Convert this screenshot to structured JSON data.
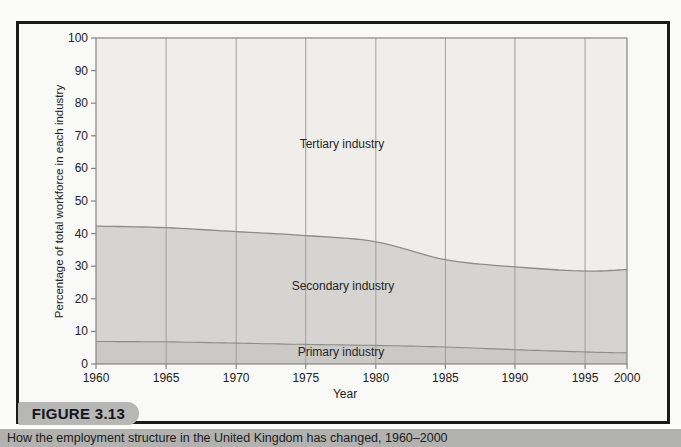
{
  "figure": {
    "badge_label": "FIGURE 3.13",
    "caption": "How the employment structure in the United Kingdom has changed, 1960–2000"
  },
  "chart": {
    "ylabel": "Percentage of total workforce in each industry",
    "xlabel": "Year",
    "area_labels": {
      "tertiary": "Tertiary industry",
      "secondary": "Secondary industry",
      "primary": "Primary industry"
    }
  },
  "chart_data": {
    "type": "area",
    "stacked": true,
    "title": "",
    "xlabel": "Year",
    "ylabel": "Percentage of total workforce in each industry",
    "categories": [
      "1960",
      "1965",
      "1970",
      "1975",
      "1980",
      "1985",
      "1990",
      "1995",
      "2000"
    ],
    "series": [
      {
        "name": "Primary industry",
        "values": [
          6.9,
          6.8,
          6.4,
          6.0,
          5.7,
          5.2,
          4.4,
          3.7,
          3.4
        ]
      },
      {
        "name": "Secondary industry",
        "values": [
          35.4,
          35.0,
          34.2,
          33.4,
          31.8,
          26.8,
          25.4,
          24.8,
          25.6
        ]
      },
      {
        "name": "Tertiary industry",
        "values": [
          57.7,
          58.2,
          59.4,
          60.6,
          62.5,
          68.0,
          70.2,
          71.5,
          71.0
        ]
      }
    ],
    "ylim": [
      0,
      100
    ],
    "yticks": [
      0,
      10,
      20,
      30,
      40,
      50,
      60,
      70,
      80,
      90,
      100
    ],
    "grid": "vertical",
    "legend_position": "none",
    "x_positions_pct": [
      0,
      13.2,
      26.4,
      39.5,
      52.7,
      65.8,
      78.9,
      92.1,
      100
    ],
    "colors": {
      "tertiary_fill": "#efeeeb",
      "secondary_fill": "#d5d4d1",
      "primary_fill": "#cac9c6",
      "boundary_line": "#8c8c89",
      "grid_line": "#9f9f9c",
      "axis_line": "#858583",
      "tick_text": "#222222"
    }
  }
}
